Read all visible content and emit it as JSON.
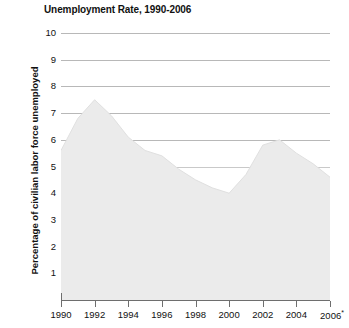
{
  "chart_data": {
    "type": "area",
    "title": "Unemployment Rate, 1990-2006",
    "xlabel": "",
    "ylabel": "Percentage of civilian labor force unemployed",
    "xlim": [
      1990,
      2006
    ],
    "ylim": [
      0,
      10
    ],
    "grid": true,
    "legend": "none",
    "fill_color": "#ebebeb",
    "gridline_color": "#b8b8b8",
    "axis_color": "#6e6e6e",
    "footnote_marker": "*",
    "y_ticks": [
      "10",
      "9",
      "8",
      "7",
      "6",
      "5",
      "4",
      "3",
      "2",
      "1"
    ],
    "y_tick_values": [
      10,
      9,
      8,
      7,
      6,
      5,
      4,
      3,
      2,
      1
    ],
    "x_ticks": [
      "1990",
      "1992",
      "1994",
      "1996",
      "1998",
      "2000",
      "2002",
      "2004",
      "2006"
    ],
    "x_tick_values": [
      1990,
      1992,
      1994,
      1996,
      1998,
      2000,
      2002,
      2004,
      2006
    ],
    "x": [
      1990,
      1991,
      1992,
      1993,
      1994,
      1995,
      1996,
      1997,
      1998,
      1999,
      2000,
      2001,
      2002,
      2003,
      2004,
      2005,
      2006
    ],
    "values": [
      5.6,
      6.8,
      7.5,
      6.9,
      6.1,
      5.6,
      5.4,
      4.9,
      4.5,
      4.2,
      4.0,
      4.7,
      5.8,
      6.0,
      5.5,
      5.1,
      4.6
    ],
    "series": [
      {
        "name": "Unemployment rate",
        "values": [
          5.6,
          6.8,
          7.5,
          6.9,
          6.1,
          5.6,
          5.4,
          4.9,
          4.5,
          4.2,
          4.0,
          4.7,
          5.8,
          6.0,
          5.5,
          5.1,
          4.6
        ]
      }
    ],
    "annotations": [
      {
        "label": "peak",
        "x": 1992,
        "y": 7.5
      },
      {
        "label": "trough",
        "x": 2000,
        "y": 4.0
      },
      {
        "label": "secondary peak",
        "x": 2003,
        "y": 6.0
      }
    ]
  }
}
